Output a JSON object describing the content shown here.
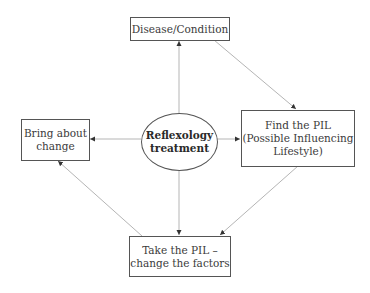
{
  "diagram": {
    "nodes": {
      "disease": {
        "lines": [
          "Disease/Condition"
        ]
      },
      "find_pil": {
        "lines": [
          "Find the PIL",
          "(Possible Influencing",
          "Lifestyle)"
        ]
      },
      "take_pil": {
        "lines": [
          "Take the PIL –",
          "change the factors"
        ]
      },
      "bring_change": {
        "lines": [
          "Bring about",
          "change"
        ]
      },
      "center": {
        "lines": [
          "Reflexology",
          "treatment"
        ]
      }
    },
    "edges": [
      {
        "from": "center",
        "to": "disease"
      },
      {
        "from": "center",
        "to": "bring_change"
      },
      {
        "from": "center",
        "to": "find_pil"
      },
      {
        "from": "center",
        "to": "take_pil"
      },
      {
        "from": "disease",
        "to": "find_pil"
      },
      {
        "from": "find_pil",
        "to": "take_pil"
      },
      {
        "from": "take_pil",
        "to": "bring_change"
      }
    ],
    "colors": {
      "line": "#b5b5b5",
      "arrow": "#333333",
      "border": "#555555"
    }
  }
}
